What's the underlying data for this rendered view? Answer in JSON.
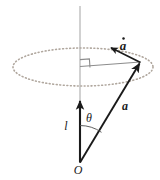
{
  "figure": {
    "background_color": "#ffffff",
    "labels": {
      "a_dot": "a",
      "a_dot_accent": "overdot",
      "a": "a",
      "l": "l",
      "theta": "θ",
      "origin": "O"
    },
    "colors": {
      "stroke_dark": "#1a1a1a",
      "stroke_gray": "#8c8c8c",
      "stroke_light_gray": "#bdbdbd",
      "ellipse_dots": "#b0a79e",
      "label_color": "#1a1a1a"
    },
    "elements": [
      {
        "name": "vertical-axis",
        "type": "line",
        "description": "light gray vertical rotation axis through the cone apex",
        "x": 80,
        "y_top": 6,
        "y_bottom": 163
      },
      {
        "name": "precession-circle",
        "type": "ellipse",
        "description": "dotted ellipse representing the circular path traced by the tip of a",
        "cx": 83,
        "cy": 67,
        "rx": 70,
        "ry": 19,
        "style": "dotted"
      },
      {
        "name": "radius-line",
        "type": "line",
        "description": "gray radius from axis to circle point",
        "x1": 80,
        "y1": 67,
        "x2": 140,
        "y2": 62
      },
      {
        "name": "right-angle-marker",
        "type": "square",
        "description": "right angle between axis and radius",
        "x": 80,
        "y": 60,
        "size": 9
      },
      {
        "name": "vector-a",
        "type": "arrow",
        "description": "vector a from origin O to point on circle",
        "x1": 80,
        "y1": 163,
        "x2": 140,
        "y2": 62
      },
      {
        "name": "vector-a-dot",
        "type": "arrow",
        "description": "time derivative of a, tangent to the circle",
        "x1": 140,
        "y1": 62,
        "x2": 110,
        "y2": 47
      },
      {
        "name": "vector-l",
        "type": "arrow",
        "description": "vector l along the vertical axis from O upward",
        "x1": 80,
        "y1": 163,
        "x2": 80,
        "y2": 100
      },
      {
        "name": "theta-arc",
        "type": "arc",
        "description": "angle theta between l and a measured at O",
        "cx": 80,
        "cy": 163,
        "radius": 38
      }
    ]
  }
}
